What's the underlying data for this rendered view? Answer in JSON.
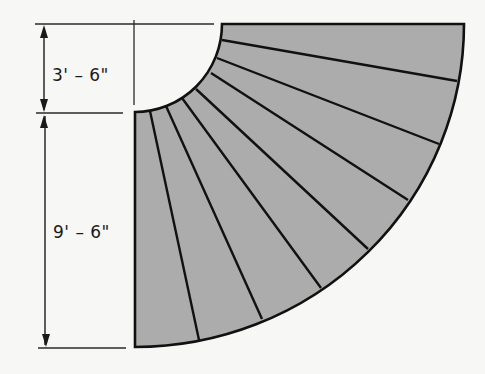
{
  "diagram": {
    "type": "curved-stair-plan",
    "colors": {
      "background": "#f7f7f5",
      "tread_fill": "#acacac",
      "stroke": "#111111",
      "dimension_line": "#2a2a2a"
    },
    "center": [
      135,
      24
    ],
    "inner_radius": {
      "rx": 87,
      "ry": 88
    },
    "outer_radius": {
      "rx": 329,
      "ry": 323
    },
    "tread_count": 8,
    "riser_lines": [
      {
        "inner": [
          222,
          40
        ],
        "outer": [
          457,
          81
        ]
      },
      {
        "inner": [
          217,
          58
        ],
        "outer": [
          439,
          144
        ]
      },
      {
        "inner": [
          211,
          73
        ],
        "outer": [
          408,
          200
        ]
      },
      {
        "inner": [
          196,
          89
        ],
        "outer": [
          368,
          249
        ]
      },
      {
        "inner": [
          182,
          98
        ],
        "outer": [
          321,
          288
        ]
      },
      {
        "inner": [
          166,
          106
        ],
        "outer": [
          262,
          319
        ]
      },
      {
        "inner": [
          150,
          111
        ],
        "outer": [
          199,
          340
        ]
      }
    ]
  },
  "dimensions": {
    "inner_radius_label": "3' – 6\"",
    "outer_width_label": "9' – 6\""
  }
}
